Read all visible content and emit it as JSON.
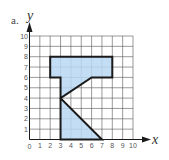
{
  "figure": {
    "part_label": "a.",
    "x_axis_label": "x",
    "y_axis_label": "y",
    "origin_label": "0"
  },
  "chart_data": {
    "type": "polygon-on-grid",
    "title": "a.",
    "xlabel": "x",
    "ylabel": "y",
    "xlim": [
      0,
      10
    ],
    "ylim": [
      0,
      10
    ],
    "grid": true,
    "x_ticks": [
      "0",
      "1",
      "2",
      "3",
      "4",
      "5",
      "6",
      "7",
      "8",
      "9",
      "10"
    ],
    "y_ticks": [
      "1",
      "2",
      "3",
      "4",
      "5",
      "6",
      "7",
      "8",
      "9",
      "10"
    ],
    "polygon": {
      "vertices": [
        [
          3,
          0
        ],
        [
          3,
          6
        ],
        [
          2,
          6
        ],
        [
          2,
          8
        ],
        [
          8,
          8
        ],
        [
          8,
          6
        ],
        [
          6,
          6
        ],
        [
          3,
          4
        ],
        [
          7,
          0
        ]
      ],
      "fill": "#b8d8f2",
      "stroke": "#1a1a1a"
    }
  },
  "colors": {
    "grid": "#555555",
    "fill": "#b8d8f2",
    "outline": "#1a1a1a",
    "axis": "#1a1a1a"
  }
}
